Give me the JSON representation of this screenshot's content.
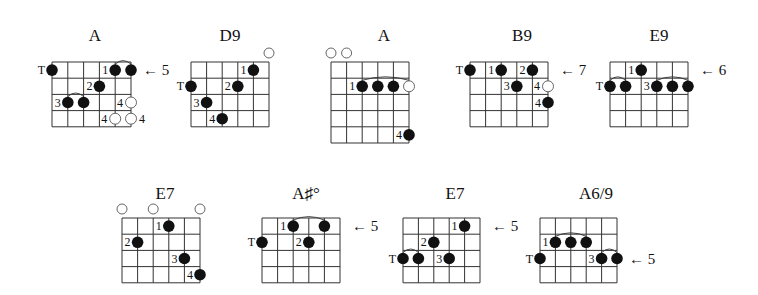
{
  "style": {
    "line_color": "#333333",
    "dot_color": "#111111",
    "open_color": "#555555",
    "background": "#ffffff"
  },
  "chords": [
    {
      "name": "A",
      "title_pos": [
        95,
        41
      ],
      "grid": {
        "x": 52,
        "y": 62,
        "width": 79,
        "rows": 4
      },
      "dots": [
        {
          "string": 0,
          "fret": 0,
          "label": "T"
        },
        {
          "string": 4,
          "fret": 0,
          "label": "1"
        },
        {
          "string": 5,
          "fret": 0,
          "label": ""
        },
        {
          "string": 3,
          "fret": 1,
          "label": "2"
        },
        {
          "string": 1,
          "fret": 2,
          "label": "3"
        },
        {
          "string": 2,
          "fret": 2,
          "label": ""
        }
      ],
      "hollow": [
        {
          "string": 5,
          "fret": 2,
          "label": "4",
          "label_side": "left"
        },
        {
          "string": 4,
          "fret": 3,
          "label": "4",
          "label_side": "left"
        },
        {
          "string": 5,
          "fret": 3,
          "label": "4",
          "label_side": "right"
        }
      ],
      "open": [],
      "arcs": [
        {
          "from": 4,
          "to": 5,
          "fret": 0
        },
        {
          "from": 1,
          "to": 2,
          "fret": 2
        }
      ],
      "fret_marker": {
        "text": "← 5",
        "row": 0
      }
    },
    {
      "name": "D9",
      "title_pos": [
        230,
        41
      ],
      "grid": {
        "x": 191,
        "y": 62,
        "width": 78,
        "rows": 4
      },
      "dots": [
        {
          "string": 4,
          "fret": 0,
          "label": "1"
        },
        {
          "string": 0,
          "fret": 1,
          "label": "T"
        },
        {
          "string": 3,
          "fret": 1,
          "label": "2"
        },
        {
          "string": 1,
          "fret": 2,
          "label": "3"
        },
        {
          "string": 2,
          "fret": 3,
          "label": "4"
        }
      ],
      "hollow": [],
      "open": [
        5
      ],
      "arcs": [],
      "fret_marker": null
    },
    {
      "name": "A",
      "title_pos": [
        384,
        41
      ],
      "grid": {
        "x": 331,
        "y": 62,
        "width": 78,
        "rows": 5
      },
      "dots": [
        {
          "string": 2,
          "fret": 1,
          "label": "1"
        },
        {
          "string": 3,
          "fret": 1,
          "label": ""
        },
        {
          "string": 4,
          "fret": 1,
          "label": ""
        },
        {
          "string": 5,
          "fret": 4,
          "label": "4"
        }
      ],
      "hollow": [
        {
          "string": 5,
          "fret": 1,
          "label": "",
          "label_side": "left"
        }
      ],
      "open": [
        0,
        1
      ],
      "arcs": [
        {
          "from": 2,
          "to": 5,
          "fret": 1
        }
      ],
      "fret_marker": null
    },
    {
      "name": "B9",
      "title_pos": [
        522,
        41
      ],
      "grid": {
        "x": 470,
        "y": 62,
        "width": 78,
        "rows": 4
      },
      "dots": [
        {
          "string": 0,
          "fret": 0,
          "label": "T"
        },
        {
          "string": 2,
          "fret": 0,
          "label": "1"
        },
        {
          "string": 4,
          "fret": 0,
          "label": "2"
        },
        {
          "string": 3,
          "fret": 1,
          "label": "3"
        },
        {
          "string": 5,
          "fret": 2,
          "label": "4"
        }
      ],
      "hollow": [
        {
          "string": 5,
          "fret": 1,
          "label": "4",
          "label_side": "left"
        }
      ],
      "open": [],
      "arcs": [],
      "fret_marker": {
        "text": "← 7",
        "row": 0
      }
    },
    {
      "name": "E9",
      "title_pos": [
        659,
        41
      ],
      "grid": {
        "x": 610,
        "y": 62,
        "width": 78,
        "rows": 4
      },
      "dots": [
        {
          "string": 2,
          "fret": 0,
          "label": "1"
        },
        {
          "string": 0,
          "fret": 1,
          "label": "T"
        },
        {
          "string": 1,
          "fret": 1,
          "label": ""
        },
        {
          "string": 3,
          "fret": 1,
          "label": "3"
        },
        {
          "string": 4,
          "fret": 1,
          "label": ""
        },
        {
          "string": 5,
          "fret": 1,
          "label": ""
        }
      ],
      "hollow": [],
      "open": [],
      "arcs": [
        {
          "from": 0,
          "to": 1,
          "fret": 1
        },
        {
          "from": 3,
          "to": 5,
          "fret": 1
        }
      ],
      "fret_marker": {
        "text": "← 6",
        "row": 0
      }
    },
    {
      "name": "E7",
      "title_pos": [
        165,
        199
      ],
      "grid": {
        "x": 122,
        "y": 218,
        "width": 78,
        "rows": 4
      },
      "dots": [
        {
          "string": 3,
          "fret": 0,
          "label": "1"
        },
        {
          "string": 1,
          "fret": 1,
          "label": "2"
        },
        {
          "string": 4,
          "fret": 2,
          "label": "3"
        },
        {
          "string": 5,
          "fret": 3,
          "label": "4"
        }
      ],
      "hollow": [],
      "open": [
        0,
        2,
        5
      ],
      "arcs": [],
      "fret_marker": null
    },
    {
      "name": "A♯°",
      "title_pos": [
        306,
        199
      ],
      "grid": {
        "x": 262,
        "y": 218,
        "width": 78,
        "rows": 4
      },
      "dots": [
        {
          "string": 2,
          "fret": 0,
          "label": "1"
        },
        {
          "string": 4,
          "fret": 0,
          "label": ""
        },
        {
          "string": 0,
          "fret": 1,
          "label": "T"
        },
        {
          "string": 3,
          "fret": 1,
          "label": "2"
        }
      ],
      "hollow": [],
      "open": [],
      "arcs": [
        {
          "from": 2,
          "to": 4,
          "fret": 0
        }
      ],
      "fret_marker": {
        "text": "← 5",
        "row": 0
      }
    },
    {
      "name": "E7",
      "title_pos": [
        455,
        199
      ],
      "grid": {
        "x": 403,
        "y": 218,
        "width": 77,
        "rows": 4
      },
      "dots": [
        {
          "string": 4,
          "fret": 0,
          "label": "1"
        },
        {
          "string": 2,
          "fret": 1,
          "label": "2"
        },
        {
          "string": 0,
          "fret": 2,
          "label": "T"
        },
        {
          "string": 1,
          "fret": 2,
          "label": ""
        },
        {
          "string": 3,
          "fret": 2,
          "label": "3"
        }
      ],
      "hollow": [],
      "open": [],
      "arcs": [
        {
          "from": 0,
          "to": 1,
          "fret": 2
        }
      ],
      "fret_marker": {
        "text": "← 5",
        "row": 0
      }
    },
    {
      "name": "A6/9",
      "title_pos": [
        596,
        199
      ],
      "grid": {
        "x": 540,
        "y": 218,
        "width": 77,
        "rows": 4
      },
      "dots": [
        {
          "string": 1,
          "fret": 1,
          "label": "1"
        },
        {
          "string": 2,
          "fret": 1,
          "label": ""
        },
        {
          "string": 3,
          "fret": 1,
          "label": ""
        },
        {
          "string": 0,
          "fret": 2,
          "label": "T"
        },
        {
          "string": 4,
          "fret": 2,
          "label": "3"
        },
        {
          "string": 5,
          "fret": 2,
          "label": ""
        }
      ],
      "hollow": [],
      "open": [],
      "arcs": [
        {
          "from": 1,
          "to": 3,
          "fret": 1
        },
        {
          "from": 4,
          "to": 5,
          "fret": 2
        }
      ],
      "fret_marker": {
        "text": "← 5",
        "row": 2
      }
    }
  ]
}
